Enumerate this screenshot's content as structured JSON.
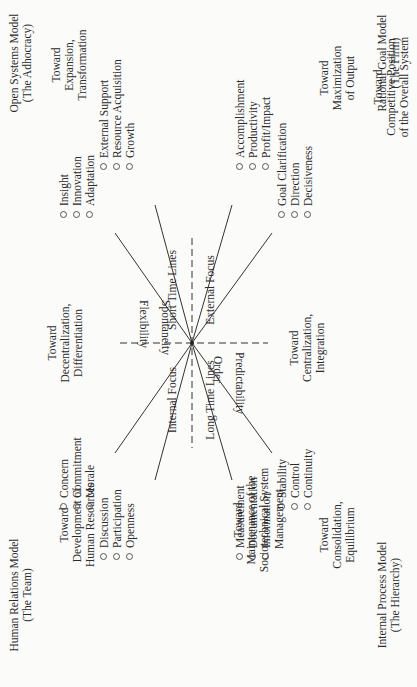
{
  "models": {
    "open_systems": {
      "name": "Open Systems Model",
      "sub": "(The Adhocracy)"
    },
    "rational_goal": {
      "name": "Rational Goal Model",
      "sub": "(The Firm)"
    },
    "human_relations": {
      "name": "Human Relations Model",
      "sub": "(The Team)"
    },
    "internal_process": {
      "name": "Internal Process Model",
      "sub": "(The Hierarchy)"
    }
  },
  "directions": {
    "expansion": [
      "Toward",
      "Expansion,",
      "Transformation"
    ],
    "competitive": [
      "Toward",
      "Competitive Position",
      "of the Overall System"
    ],
    "maximization": [
      "Toward",
      "Maximization",
      "of Output"
    ],
    "decentralization": [
      "Toward",
      "Decentralization,",
      "Differentiation"
    ],
    "centralization": [
      "Toward",
      "Centralization,",
      "Integration"
    ],
    "development": [
      "Toward",
      "Development of",
      "Human Resources"
    ],
    "maintenance": [
      "Toward",
      "Maintenance of the",
      "Sociotechnical System"
    ],
    "consolidation": [
      "Toward",
      "Consolidation,",
      "Equilibrium"
    ]
  },
  "axes": {
    "short_time_lines": "Short Time Lines",
    "external_focus": "External Focus",
    "internal_focus": "Internal Focus",
    "long_time_lines": "Long Time Lines",
    "flexibility": "Flexibility",
    "spontaneity": "Spontaneity",
    "order": "Order",
    "predictability": "Predictability"
  },
  "groups": {
    "innovation": [
      "Insight",
      "Innovation",
      "Adaptation"
    ],
    "resources": [
      "External Support",
      "Resource Acquisition",
      "Growth"
    ],
    "output": [
      "Accomplishment",
      "Productivity",
      "Profit/Impact"
    ],
    "goals": [
      "Goal Clarification",
      "Direction",
      "Decisiveness"
    ],
    "stability": [
      "Stability",
      "Control",
      "Continuity"
    ],
    "information": [
      "Measurement",
      "Documentation",
      "Information",
      "Management"
    ],
    "participation": [
      "Discussion",
      "Participation",
      "Openness"
    ],
    "morale": [
      "Concern",
      "Commitment",
      "Morale"
    ]
  },
  "colors": {
    "ink": "#2a2a2a",
    "line": "#333333",
    "paper": "#fbfbfa"
  }
}
